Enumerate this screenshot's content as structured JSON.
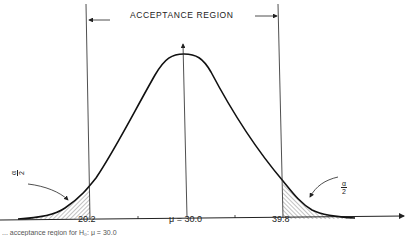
{
  "diagram": {
    "title": "ACCEPTANCE REGION",
    "lower_critical_value": "20.2",
    "mean_label": "μ = 30.0",
    "upper_critical_value": "39.8",
    "left_tail_label": {
      "numerator": "α",
      "denominator": "2"
    },
    "right_tail_label": {
      "numerator": "α",
      "denominator": "2"
    },
    "caption_partial": "... acceptance region for H₀: μ = 30.0",
    "colors": {
      "ink": "#222222",
      "background": "#ffffff"
    }
  }
}
